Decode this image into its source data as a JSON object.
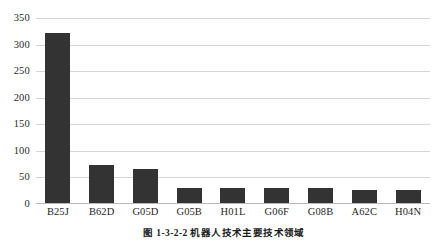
{
  "chart_data": {
    "type": "bar",
    "title": "",
    "subtitle": "",
    "xlabel": "",
    "ylabel": "",
    "categories": [
      "B25J",
      "B62D",
      "G05D",
      "G05B",
      "H01L",
      "G06F",
      "G08B",
      "A62C",
      "H04N"
    ],
    "values": [
      320,
      71,
      64,
      29,
      29,
      29,
      29,
      25,
      25
    ],
    "series": [
      {
        "name": "专利申请量",
        "values": [
          320,
          71,
          64,
          29,
          29,
          29,
          29,
          25,
          25
        ]
      }
    ],
    "ylim": [
      0,
      350
    ],
    "ytick_values": [
      0,
      50,
      100,
      150,
      200,
      250,
      300,
      350
    ],
    "ytick_labels": [
      "0",
      "50",
      "100",
      "150",
      "200",
      "250",
      "300",
      "350"
    ],
    "grid": "horizontal",
    "legend": "none",
    "bar_color": "#333333",
    "gridline_color": "#d6d6d6",
    "background_color": "#ffffff"
  },
  "caption": {
    "text": "图 1-3-2-2  机器人技术主要技术领域"
  }
}
